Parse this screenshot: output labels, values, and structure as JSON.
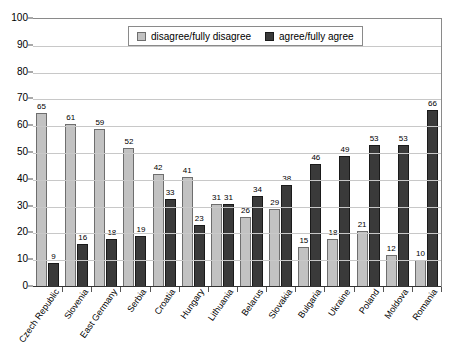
{
  "chart_data": {
    "type": "bar",
    "title": "",
    "subtitle": "",
    "xlabel": "",
    "ylabel": "",
    "ylim": [
      0,
      100
    ],
    "yticks": [
      0,
      10,
      20,
      30,
      40,
      50,
      60,
      70,
      80,
      90,
      100
    ],
    "grid": true,
    "legend_position": "top-center",
    "categories": [
      "Czech Republic",
      "Slovenia",
      "East Germany",
      "Serbia",
      "Croatia",
      "Hungary",
      "Lithuania",
      "Belarus",
      "Slovakia",
      "Bulgaria",
      "Ukraine",
      "Poland",
      "Moldova",
      "Romania"
    ],
    "series": [
      {
        "name": "disagree/fully disagree",
        "color": "#c2c2c2",
        "values": [
          65,
          61,
          59,
          52,
          42,
          41,
          31,
          26,
          29,
          15,
          18,
          21,
          12,
          10
        ]
      },
      {
        "name": "agree/fully agree",
        "color": "#3a3a3a",
        "values": [
          9,
          16,
          18,
          19,
          33,
          23,
          31,
          34,
          38,
          46,
          49,
          53,
          53,
          66
        ]
      }
    ]
  },
  "legend": {
    "items": [
      {
        "label": "disagree/fully disagree",
        "swatch": "light"
      },
      {
        "label": "agree/fully agree",
        "swatch": "dark"
      }
    ]
  }
}
